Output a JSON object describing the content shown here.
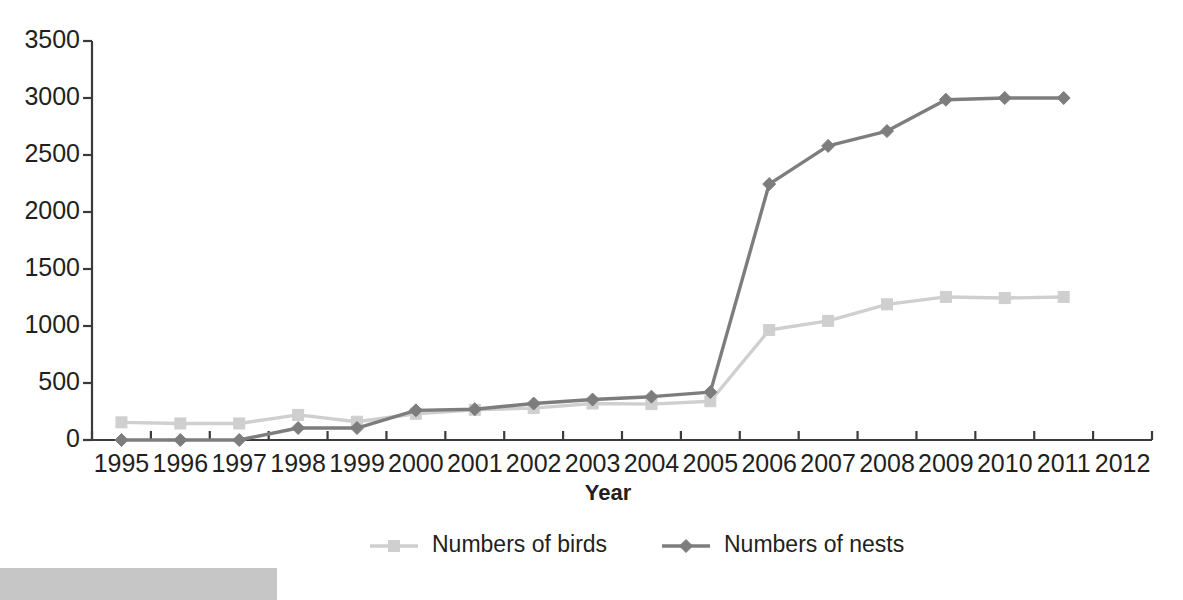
{
  "chart_data": {
    "type": "line",
    "title": "",
    "subtitle": "",
    "xlabel": "Year",
    "ylabel": "",
    "categories": [
      "1995",
      "1996",
      "1997",
      "1998",
      "1999",
      "2000",
      "2001",
      "2002",
      "2003",
      "2004",
      "2005",
      "2006",
      "2007",
      "2008",
      "2009",
      "2010",
      "2011",
      "2012"
    ],
    "xlim": [
      1995,
      2012
    ],
    "ylim": [
      0,
      3500
    ],
    "yticks": [
      0,
      500,
      1000,
      1500,
      2000,
      2500,
      3000,
      3500
    ],
    "ytick_labels": [
      "0",
      "500",
      "1000",
      "1500",
      "2000",
      "2500",
      "3000",
      "3500"
    ],
    "grid": false,
    "legend_position": "bottom",
    "series": [
      {
        "name": "Numbers of birds",
        "color": "#cfcfcf",
        "marker": "square",
        "x": [
          "1995",
          "1996",
          "1997",
          "1998",
          "1999",
          "2000",
          "2001",
          "2002",
          "2003",
          "2004",
          "2005",
          "2006",
          "2007",
          "2008",
          "2009",
          "2010",
          "2011"
        ],
        "values": [
          155,
          145,
          145,
          220,
          160,
          230,
          265,
          280,
          320,
          315,
          340,
          965,
          1045,
          1190,
          1255,
          1245,
          1255
        ]
      },
      {
        "name": "Numbers of nests",
        "color": "#7d7d7d",
        "marker": "diamond",
        "x": [
          "1995",
          "1996",
          "1997",
          "1998",
          "1999",
          "2000",
          "2001",
          "2002",
          "2003",
          "2004",
          "2005",
          "2006",
          "2007",
          "2008",
          "2009",
          "2010",
          "2011"
        ],
        "values": [
          0,
          0,
          0,
          105,
          105,
          260,
          270,
          320,
          355,
          380,
          420,
          2245,
          2580,
          2710,
          2985,
          3000,
          3000
        ]
      }
    ]
  },
  "legend": {
    "items": [
      {
        "label": "Numbers of birds",
        "color": "#cfcfcf",
        "marker": "square"
      },
      {
        "label": "Numbers of nests",
        "color": "#7d7d7d",
        "marker": "diamond"
      }
    ]
  },
  "axes": {
    "x_title": "Year",
    "axis_color": "#3b3b3b"
  }
}
